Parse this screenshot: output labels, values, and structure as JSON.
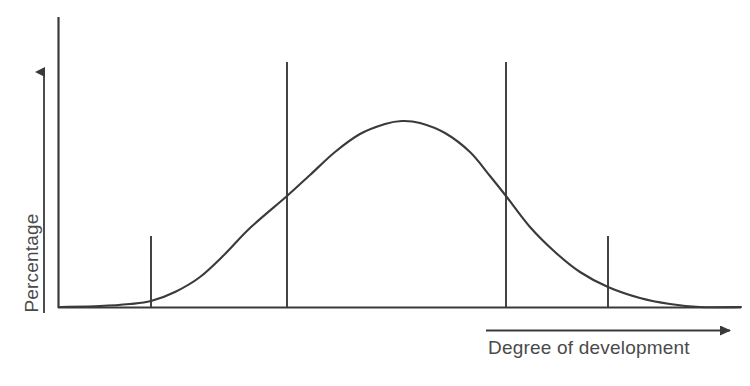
{
  "figure": {
    "type": "diagram",
    "background_color": "#ffffff",
    "stroke_color": "#3a3a3a",
    "text_color": "#4a4a4a"
  },
  "axes": {
    "y": {
      "label": "Percentage",
      "arrow": {
        "x": 44,
        "y_bottom": 312,
        "y_top": 62
      },
      "spine": {
        "x": 58,
        "y_top": 17,
        "y_bottom": 308
      }
    },
    "x": {
      "label": "Degree of development",
      "arrow": {
        "y": 330,
        "x_start": 485,
        "x_end": 741
      },
      "baseline": {
        "y": 308,
        "x_start": 58,
        "x_end": 741
      }
    }
  },
  "chart_data": {
    "type": "line",
    "title": "",
    "xlabel": "Degree of development",
    "ylabel": "Percentage",
    "grid": false,
    "legend": "none",
    "axis_ticks_shown": false,
    "curve": {
      "name": "Normal distribution of development",
      "shape": "bell",
      "peak": {
        "x": 402,
        "y": 121
      },
      "baseline_y": 308,
      "start": {
        "x": 60,
        "y": 307
      },
      "end": {
        "x": 741,
        "y": 307
      },
      "points": [
        [
          60,
          307
        ],
        [
          100,
          306
        ],
        [
          130,
          304
        ],
        [
          151,
          301
        ],
        [
          175,
          292
        ],
        [
          200,
          277
        ],
        [
          225,
          254
        ],
        [
          250,
          228
        ],
        [
          287,
          196
        ],
        [
          310,
          175
        ],
        [
          335,
          152
        ],
        [
          360,
          134
        ],
        [
          385,
          124
        ],
        [
          402,
          121
        ],
        [
          420,
          123
        ],
        [
          445,
          133
        ],
        [
          470,
          152
        ],
        [
          490,
          176
        ],
        [
          506,
          196
        ],
        [
          530,
          227
        ],
        [
          555,
          252
        ],
        [
          580,
          272
        ],
        [
          608,
          287
        ],
        [
          640,
          298
        ],
        [
          670,
          304
        ],
        [
          700,
          307
        ],
        [
          741,
          307
        ]
      ]
    },
    "divider_lines": [
      {
        "name": "divider-1",
        "x": 151,
        "y_top": 235,
        "y_bottom": 308,
        "height_class": "short"
      },
      {
        "name": "divider-2",
        "x": 287,
        "y_top": 62,
        "y_bottom": 308,
        "height_class": "tall"
      },
      {
        "name": "divider-3",
        "x": 506,
        "y_top": 62,
        "y_bottom": 308,
        "height_class": "tall"
      },
      {
        "name": "divider-4",
        "x": 608,
        "y_top": 235,
        "y_bottom": 308,
        "height_class": "short"
      }
    ]
  }
}
